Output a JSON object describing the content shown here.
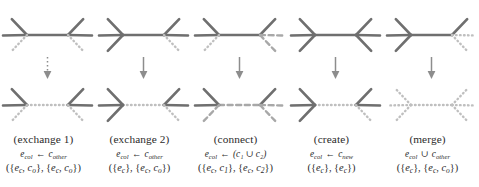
{
  "figure": {
    "title": "",
    "background": "#ffffff",
    "colors": {
      "solid_edge": "#6f6f6f",
      "dotted_edge": "#bfbfbf",
      "dashed_edge": "#a8a8a8",
      "arrow": "#8d8d8d",
      "text": "#2b2b2b"
    },
    "rows": [
      "before",
      "after"
    ],
    "arrow_glyph": "down-arrow"
  },
  "columns": [
    {
      "id": "exchange-1",
      "operation": "(exchange 1)",
      "rule": {
        "lhs": "e",
        "lhs_sub": "col",
        "arrow": "←",
        "rhs": "c",
        "rhs_sub": "other"
      },
      "sets": {
        "left": "{e_c, c_o}",
        "right": "{e_c, c_o}"
      },
      "sets_parts": [
        "({",
        "e",
        "c",
        ", ",
        "c",
        "o",
        "}, {",
        "e",
        "c",
        ", ",
        "c",
        "o",
        "})"
      ],
      "top": {
        "center_edge": "solid",
        "left_spokes": [
          "solid",
          "solid",
          "dotted"
        ],
        "right_spokes": [
          "solid",
          "solid",
          "dotted"
        ]
      },
      "bottom": {
        "center_edge": "dotted",
        "left_spokes": [
          "solid",
          "solid",
          "dotted"
        ],
        "right_spokes": [
          "solid",
          "solid",
          "dotted"
        ]
      }
    },
    {
      "id": "exchange-2",
      "operation": "(exchange 2)",
      "rule": {
        "lhs": "e",
        "lhs_sub": "col",
        "arrow": "←",
        "rhs": "c",
        "rhs_sub": "other"
      },
      "sets": {
        "left": "{e_c}",
        "right": "{e_c, c_o}"
      },
      "top": {
        "center_edge": "solid",
        "left_spokes": [
          "solid",
          "solid",
          "solid"
        ],
        "right_spokes": [
          "solid",
          "solid",
          "dotted"
        ]
      },
      "bottom": {
        "center_edge": "dotted",
        "left_spokes": [
          "solid",
          "solid",
          "solid"
        ],
        "right_spokes": [
          "solid",
          "solid",
          "dotted"
        ]
      }
    },
    {
      "id": "connect",
      "operation": "(connect)",
      "rule": {
        "lhs": "e",
        "lhs_sub": "col",
        "arrow": "←",
        "rhs": "(c₁ ∪ c₂)",
        "rhs_sub": ""
      },
      "sets": {
        "left": "{e_c, c_1}",
        "right": "{e_c, c_2}"
      },
      "top": {
        "center_edge": "solid",
        "left_spokes": [
          "solid",
          "solid",
          "dotted"
        ],
        "right_spokes": [
          "solid",
          "dashed",
          "dashed"
        ]
      },
      "bottom": {
        "center_edge": "dashed",
        "left_spokes": [
          "solid",
          "solid",
          "dashed"
        ],
        "right_spokes": [
          "solid",
          "dashed",
          "dashed"
        ]
      }
    },
    {
      "id": "create",
      "operation": "(create)",
      "rule": {
        "lhs": "e",
        "lhs_sub": "col",
        "arrow": "←",
        "rhs": "c",
        "rhs_sub": "new"
      },
      "sets": {
        "left": "{e_c}",
        "right": "{e_c}"
      },
      "top": {
        "center_edge": "solid",
        "left_spokes": [
          "solid",
          "solid",
          "solid"
        ],
        "right_spokes": [
          "solid",
          "solid",
          "solid"
        ]
      },
      "bottom": {
        "center_edge": "dotted",
        "left_spokes": [
          "solid",
          "solid",
          "solid"
        ],
        "right_spokes": [
          "solid",
          "solid",
          "dotted"
        ]
      }
    },
    {
      "id": "merge",
      "operation": "(merge)",
      "rule": {
        "lhs": "e",
        "lhs_sub": "col",
        "arrow": "∪",
        "rhs": "c",
        "rhs_sub": "other"
      },
      "sets": {
        "left": "{e_c}",
        "right": "{e_c, c_o}"
      },
      "top": {
        "center_edge": "solid",
        "left_spokes": [
          "solid",
          "solid",
          "solid"
        ],
        "right_spokes": [
          "solid",
          "dotted",
          "dotted"
        ]
      },
      "bottom": {
        "center_edge": "dotted",
        "left_spokes": [
          "dotted",
          "dotted",
          "dotted"
        ],
        "right_spokes": [
          "dotted",
          "dotted",
          "dotted"
        ]
      }
    }
  ]
}
